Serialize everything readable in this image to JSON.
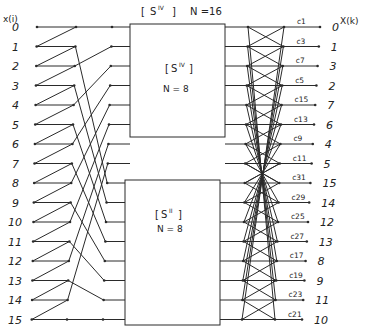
{
  "title": {
    "bracket_label": "[ Sᴵⱽ ]",
    "superscript": "IV",
    "base": "S",
    "size_label": "N =16"
  },
  "input_axis_label": "x(i)",
  "output_axis_label": "X(k)",
  "inputs": [
    "0",
    "1",
    "2",
    "3",
    "4",
    "5",
    "6",
    "7",
    "8",
    "9",
    "10",
    "11",
    "12",
    "13",
    "14",
    "15"
  ],
  "upper_block": {
    "base": "S",
    "superscript": "IV",
    "size_label": "N = 8"
  },
  "lower_block": {
    "base": "S",
    "superscript": "II",
    "size_label": "N = 8"
  },
  "outputs": [
    {
      "coef": "c1",
      "k": "0"
    },
    {
      "coef": "c3",
      "k": "1"
    },
    {
      "coef": "c7",
      "k": "3"
    },
    {
      "coef": "c5",
      "k": "2"
    },
    {
      "coef": "c15",
      "k": "7"
    },
    {
      "coef": "c13",
      "k": "6"
    },
    {
      "coef": "c9",
      "k": "4"
    },
    {
      "coef": "c11",
      "k": "5"
    },
    {
      "coef": "c31",
      "k": "15"
    },
    {
      "coef": "c29",
      "k": "14"
    },
    {
      "coef": "c25",
      "k": "12"
    },
    {
      "coef": "c27",
      "k": "13"
    },
    {
      "coef": "c17",
      "k": "8"
    },
    {
      "coef": "c19",
      "k": "9"
    },
    {
      "coef": "c23",
      "k": "11"
    },
    {
      "coef": "c21",
      "k": "10"
    }
  ],
  "caption": "Fig. ...",
  "colors": {
    "line": "#2a2a2a",
    "text": "#222222",
    "background": "#ffffff"
  }
}
